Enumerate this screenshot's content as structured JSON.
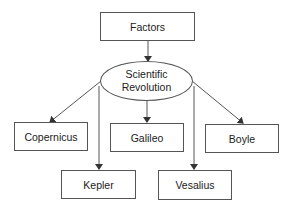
{
  "diagram": {
    "type": "concept-map",
    "top_node": {
      "label": "Factors"
    },
    "center_node": {
      "line1": "Scientific",
      "line2": "Revolution"
    },
    "children": [
      {
        "label": "Copernicus"
      },
      {
        "label": "Galileo"
      },
      {
        "label": "Boyle"
      },
      {
        "label": "Kepler"
      },
      {
        "label": "Vesalius"
      }
    ],
    "edges": [
      {
        "from": "Factors",
        "to": "Scientific Revolution"
      },
      {
        "from": "Scientific Revolution",
        "to": "Copernicus"
      },
      {
        "from": "Scientific Revolution",
        "to": "Galileo"
      },
      {
        "from": "Scientific Revolution",
        "to": "Boyle"
      },
      {
        "from": "Scientific Revolution",
        "to": "Kepler"
      },
      {
        "from": "Scientific Revolution",
        "to": "Vesalius"
      }
    ],
    "colors": {
      "stroke": "#555555",
      "text": "#222222",
      "background": "#ffffff"
    }
  }
}
